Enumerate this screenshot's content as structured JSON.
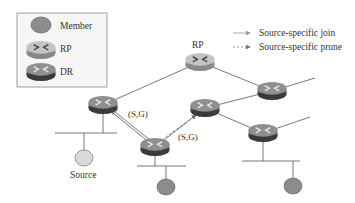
{
  "legend": {
    "member_label": "Member",
    "rp_label": "RP",
    "dr_label": "DR"
  },
  "arrow_legend": {
    "join_label": "Source-specific join",
    "prune_label": "Source-specific prune"
  },
  "diagram": {
    "rp_label": "RP",
    "source_label": "Source",
    "sg_label_join": "(S,G)",
    "sg_label_prune": "(S,G)"
  },
  "colors": {
    "member_fill": "#8c8c8c",
    "source_fill": "#d9d9d9",
    "rp_fill": "#b0b0b0",
    "dr_fill": "#6e6e6e",
    "link": "#555555",
    "join_arrow": "#b0b0b0",
    "prune_arrow": "#888888"
  }
}
